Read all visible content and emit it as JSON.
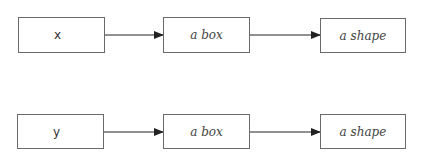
{
  "diagram": {
    "rows": [
      {
        "source": "x",
        "middle": "a box",
        "target": "a shape"
      },
      {
        "source": "y",
        "middle": "a box",
        "target": "a shape"
      }
    ],
    "colors": {
      "border": "#6a6a6a",
      "arrow": "#222222",
      "background": "#ffffff"
    }
  }
}
